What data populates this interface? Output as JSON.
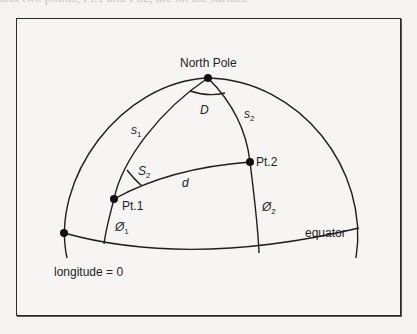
{
  "page": {
    "cropped_text_top": "and two points, Pt.1 and Pt.2, are on the surface"
  },
  "diagram": {
    "title": "",
    "labels": {
      "north_pole": "North Pole",
      "angle_D": "D",
      "arc_s1": "s",
      "arc_s1_sub": "1",
      "arc_s2": "s",
      "arc_s2_sub": "2",
      "angle_S2": "S",
      "angle_S2_sub": "2",
      "distance_d": "d",
      "point_1": "Pt.1",
      "point_2": "Pt.2",
      "lat_1": "Ø",
      "lat_1_sub": "1",
      "lat_2": "Ø",
      "lat_2_sub": "2",
      "equator": "equator",
      "longitude_zero": "longitude = 0"
    },
    "points": [
      {
        "name": "North Pole",
        "x": 208,
        "y": 78
      },
      {
        "name": "Pt.1",
        "x": 114,
        "y": 199
      },
      {
        "name": "Pt.2",
        "x": 250,
        "y": 162
      },
      {
        "name": "longitude = 0 / equator intersection",
        "x": 64,
        "y": 233
      }
    ],
    "colors": {
      "stroke": "#1e1e1e",
      "background": "#f6f5f3",
      "frame": "#2a2a2a"
    }
  }
}
